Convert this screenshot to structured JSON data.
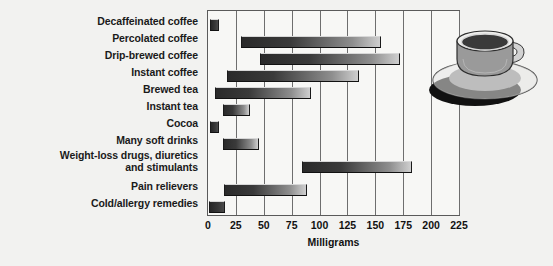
{
  "chart_data": {
    "type": "bar",
    "orientation": "horizontal",
    "subtype": "range-bar",
    "title": "",
    "xlabel": "Milligrams",
    "ylabel": "",
    "xlim": [
      0,
      225
    ],
    "xticks": [
      0,
      25,
      50,
      75,
      100,
      125,
      150,
      175,
      200,
      225
    ],
    "xtick_labels": [
      "0",
      "25",
      "50",
      "75",
      "100",
      "125",
      "150",
      "175",
      "200",
      "225"
    ],
    "grid": true,
    "legend": null,
    "categories": [
      "Decaffeinated coffee",
      "Percolated coffee",
      "Drip-brewed coffee",
      "Instant coffee",
      "Brewed tea",
      "Instant tea",
      "Cocoa",
      "Many soft drinks",
      "Weight-loss drugs, diuretics\nand stimulants",
      "Pain relievers",
      "Cold/allergy remedies"
    ],
    "ranges": [
      {
        "category": "Decaffeinated coffee",
        "low": 2,
        "high": 10
      },
      {
        "category": "Percolated coffee",
        "low": 30,
        "high": 155
      },
      {
        "category": "Drip-brewed coffee",
        "low": 47,
        "high": 172
      },
      {
        "category": "Instant coffee",
        "low": 17,
        "high": 135
      },
      {
        "category": "Brewed tea",
        "low": 6,
        "high": 92
      },
      {
        "category": "Instant tea",
        "low": 13,
        "high": 38
      },
      {
        "category": "Cocoa",
        "low": 2,
        "high": 10
      },
      {
        "category": "Many soft drinks",
        "low": 13,
        "high": 46
      },
      {
        "category": "Weight-loss drugs, diuretics and stimulants",
        "low": 84,
        "high": 183
      },
      {
        "category": "Pain relievers",
        "low": 14,
        "high": 89
      },
      {
        "category": "Cold/allergy remedies",
        "low": 1,
        "high": 15
      }
    ]
  },
  "axis": {
    "xlabel": "Milligrams",
    "ticks": [
      "0",
      "25",
      "50",
      "75",
      "100",
      "125",
      "150",
      "175",
      "200",
      "225"
    ]
  },
  "labels": {
    "decaffeinated_coffee": "Decaffeinated coffee",
    "percolated_coffee": "Percolated coffee",
    "drip_brewed_coffee": "Drip-brewed coffee",
    "instant_coffee": "Instant coffee",
    "brewed_tea": "Brewed tea",
    "instant_tea": "Instant tea",
    "cocoa": "Cocoa",
    "many_soft_drinks": "Many soft drinks",
    "weight_loss_drugs": "Weight-loss drugs, diuretics\nand stimulants",
    "pain_relievers": "Pain relievers",
    "cold_allergy_remedies": "Cold/allergy remedies"
  },
  "art": {
    "coffee_cup": "coffee-cup-and-saucer-illustration"
  },
  "colors": {
    "background": "#f2f2f0",
    "plot_background": "#f7f7f5",
    "frame": "#5a5a5a",
    "gridline": "#6e6e6e",
    "bar_dark": "#2a2a2a",
    "bar_light": "#cfcfcf",
    "text": "#1a1a1a"
  }
}
